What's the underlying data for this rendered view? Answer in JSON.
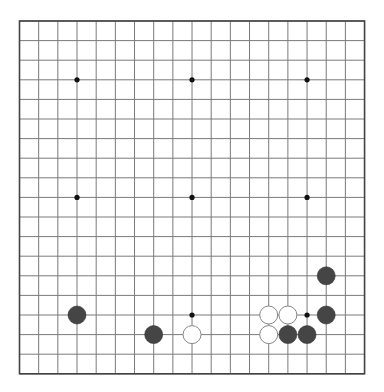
{
  "board": {
    "size": 19,
    "origin": {
      "x": 19.5,
      "y": 21
    },
    "spacing": {
      "x": 19.17,
      "y": 19.6
    },
    "line_color": "#7a7a7a",
    "border_color": "#444444",
    "star_color": "#111111",
    "black_stone_color": "#454545",
    "white_stone_color": "#ffffff",
    "white_stone_stroke": "#888888",
    "stone_radius": 9,
    "star_points": [
      [
        3,
        3
      ],
      [
        9,
        3
      ],
      [
        15,
        3
      ],
      [
        3,
        9
      ],
      [
        9,
        9
      ],
      [
        15,
        9
      ],
      [
        3,
        15
      ],
      [
        9,
        15
      ],
      [
        15,
        15
      ]
    ],
    "stones": [
      {
        "color": "black",
        "col": 3,
        "row": 15
      },
      {
        "color": "black",
        "col": 7,
        "row": 16
      },
      {
        "color": "white",
        "col": 9,
        "row": 16
      },
      {
        "color": "white",
        "col": 13,
        "row": 15
      },
      {
        "color": "white",
        "col": 14,
        "row": 15
      },
      {
        "color": "white",
        "col": 13,
        "row": 16
      },
      {
        "color": "black",
        "col": 14,
        "row": 16
      },
      {
        "color": "black",
        "col": 15,
        "row": 16
      },
      {
        "color": "black",
        "col": 16,
        "row": 15
      },
      {
        "color": "black",
        "col": 16,
        "row": 13
      }
    ]
  }
}
